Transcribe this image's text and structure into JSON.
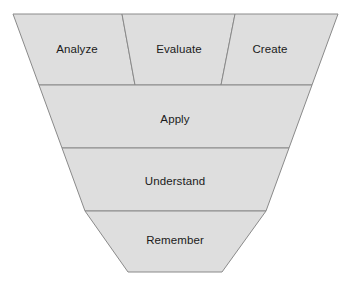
{
  "diagram": {
    "name": "inverted-funnel-taxonomy",
    "background_color": "#ffffff",
    "fill_color": "#dedede",
    "stroke_color": "#8a8a8a",
    "label_color": "#1a1a1a",
    "outline": {
      "top_left": [
        13,
        14
      ],
      "top_right": [
        338,
        14
      ],
      "bottom_right": [
        222,
        272
      ],
      "bottom_left": [
        128,
        272
      ]
    },
    "rows": [
      {
        "row_index": 0,
        "y_top": 14,
        "y_bottom": 85,
        "cells": [
          {
            "label": "Analyze",
            "points": "13,14 122,14 135,85 39,85",
            "label_x": 77,
            "label_y": 50
          },
          {
            "label": "Evaluate",
            "points": "122,14 235,14 221,85 135,85",
            "label_x": 179,
            "label_y": 50
          },
          {
            "label": "Create",
            "points": "235,14 338,14 312,85 221,85",
            "label_x": 270,
            "label_y": 50
          }
        ]
      },
      {
        "row_index": 1,
        "y_top": 85,
        "y_bottom": 148,
        "cells": [
          {
            "label": "Apply",
            "points": "39,85 312,85 289,148 62,148",
            "label_x": 175,
            "label_y": 120
          }
        ]
      },
      {
        "row_index": 2,
        "y_top": 148,
        "y_bottom": 211,
        "cells": [
          {
            "label": "Understand",
            "points": "62,148 289,148 266,211 85,211",
            "label_x": 175,
            "label_y": 182
          }
        ]
      },
      {
        "row_index": 3,
        "y_top": 211,
        "y_bottom": 272,
        "cells": [
          {
            "label": "Remember",
            "points": "85,211 266,211 222,272 128,272",
            "label_x": 175,
            "label_y": 241
          }
        ]
      }
    ]
  }
}
